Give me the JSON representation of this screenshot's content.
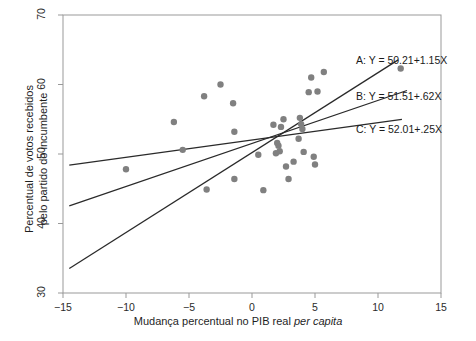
{
  "chart_data": {
    "type": "scatter",
    "title": "",
    "xlabel": "Mudança percentual no PIB real per capita",
    "xlabel_plain": "Mudança percentual no PIB real ",
    "xlabel_italic": "per capita",
    "ylabel_line1": "Percentual de votos recebidos",
    "ylabel_line2": "pelo partido do incumbente",
    "xlim": [
      -15,
      15
    ],
    "ylim": [
      30,
      70
    ],
    "xticks": [
      -15,
      -10,
      -5,
      0,
      5,
      10,
      15
    ],
    "xtick_labels": [
      "−15",
      "−10",
      "−5",
      "0",
      "5",
      "10",
      "15"
    ],
    "yticks": [
      30,
      40,
      50,
      60,
      70
    ],
    "ytick_labels": [
      "30",
      "40",
      "50",
      "60",
      "70"
    ],
    "grid": false,
    "legend_position": "right-inside-annotations",
    "point_color": "#808080",
    "line_color": "#2a2a2a",
    "axis_color": "#999999",
    "points": [
      {
        "x": -10.0,
        "y": 47.8
      },
      {
        "x": -6.2,
        "y": 54.6
      },
      {
        "x": -5.5,
        "y": 50.6
      },
      {
        "x": -3.8,
        "y": 58.3
      },
      {
        "x": -3.6,
        "y": 44.9
      },
      {
        "x": -2.5,
        "y": 60.0
      },
      {
        "x": -1.5,
        "y": 57.3
      },
      {
        "x": -1.4,
        "y": 53.2
      },
      {
        "x": -1.4,
        "y": 46.4
      },
      {
        "x": 0.5,
        "y": 49.9
      },
      {
        "x": 0.9,
        "y": 44.8
      },
      {
        "x": 1.7,
        "y": 54.2
      },
      {
        "x": 1.9,
        "y": 50.1
      },
      {
        "x": 2.0,
        "y": 51.6
      },
      {
        "x": 2.1,
        "y": 51.2
      },
      {
        "x": 2.2,
        "y": 50.4
      },
      {
        "x": 2.3,
        "y": 53.9
      },
      {
        "x": 2.5,
        "y": 55.0
      },
      {
        "x": 2.7,
        "y": 48.2
      },
      {
        "x": 2.9,
        "y": 46.4
      },
      {
        "x": 3.3,
        "y": 48.9
      },
      {
        "x": 3.7,
        "y": 52.2
      },
      {
        "x": 3.8,
        "y": 55.2
      },
      {
        "x": 3.9,
        "y": 54.3
      },
      {
        "x": 4.0,
        "y": 53.6
      },
      {
        "x": 4.1,
        "y": 50.3
      },
      {
        "x": 4.5,
        "y": 58.9
      },
      {
        "x": 4.7,
        "y": 61.0
      },
      {
        "x": 4.9,
        "y": 49.6
      },
      {
        "x": 5.0,
        "y": 48.5
      },
      {
        "x": 5.2,
        "y": 59.0
      },
      {
        "x": 5.7,
        "y": 61.8
      },
      {
        "x": 11.8,
        "y": 62.3
      }
    ],
    "series": [
      {
        "name": "A",
        "label": "A: Y = 50.21+1.15X",
        "intercept": 50.21,
        "slope": 1.15,
        "x_start": -14.5,
        "x_end": 11.6
      },
      {
        "name": "B",
        "label": "B: Y = 51.51+.62X",
        "intercept": 51.51,
        "slope": 0.62,
        "x_start": -14.5,
        "x_end": 12.3
      },
      {
        "name": "C",
        "label": "C: Y = 52.01+.25X",
        "intercept": 52.01,
        "slope": 0.25,
        "x_start": -14.5,
        "x_end": 11.9
      }
    ]
  }
}
